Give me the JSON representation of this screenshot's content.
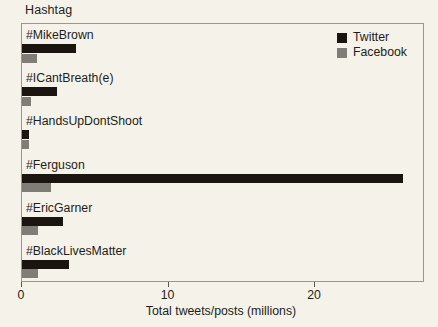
{
  "chart_data": {
    "type": "bar",
    "orientation": "horizontal",
    "title": "",
    "xlabel": "Total tweets/posts (millions)",
    "ylabel": "Hashtag",
    "xlim": [
      0,
      27.5
    ],
    "xticks": [
      0,
      10,
      20
    ],
    "xtick_labels": [
      "0",
      "10",
      "20"
    ],
    "grid": false,
    "legend_position": "top-right",
    "categories": [
      "#MikeBrown",
      "#ICantBreath(e)",
      "#HandsUpDontShoot",
      "#Ferguson",
      "#EricGarner",
      "#BlackLivesMatter"
    ],
    "series": [
      {
        "name": "Twitter",
        "color": "#1b1510",
        "values": [
          3.7,
          2.4,
          0.5,
          26.0,
          2.8,
          3.2
        ]
      },
      {
        "name": "Facebook",
        "color": "#807d77",
        "values": [
          1.0,
          0.6,
          0.45,
          2.0,
          1.1,
          1.1
        ]
      }
    ]
  },
  "axes": {
    "y_caption": "Hashtag",
    "x_caption": "Total tweets/posts (millions)"
  },
  "legend": {
    "items": [
      {
        "label": "Twitter",
        "color": "#1b1510"
      },
      {
        "label": "Facebook",
        "color": "#807d77"
      }
    ]
  }
}
